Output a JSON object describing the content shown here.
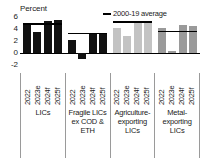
{
  "figure": {
    "axis_unit_label": "Percent",
    "legend": {
      "marker_name": "average-line-marker",
      "label": "2000-19 average"
    }
  },
  "chart_data": {
    "type": "bar",
    "title": "",
    "subtitle": "",
    "xlabel": "",
    "ylabel": "Percent",
    "ylim": [
      -2,
      6
    ],
    "yticks": [
      6,
      4,
      2,
      0,
      -2
    ],
    "ytick_labels": [
      "6",
      "4",
      "2",
      "0",
      "-2"
    ],
    "grid": false,
    "legend_position": "top-right",
    "legend_entries": [
      "2000-19 average"
    ],
    "categories": [
      "2022",
      "2023e",
      "2024f",
      "2025f"
    ],
    "groups": [
      {
        "name": "LICs",
        "color": "#111111",
        "values": [
          4.8,
          3.5,
          5.3,
          5.5
        ],
        "average_2000_19": 5.0
      },
      {
        "name": "Fragile LICs ex COD & ETH",
        "color": "#111111",
        "values": [
          2.2,
          -1.0,
          3.3,
          3.3
        ],
        "average_2000_19": 3.4
      },
      {
        "name": "Agriculture-exporting LICs",
        "color": "#c3c3c3",
        "values": [
          4.1,
          2.8,
          5.0,
          5.1
        ],
        "average_2000_19": 5.3
      },
      {
        "name": "Metal-exporting LICs",
        "color": "#9a9a9a",
        "values": [
          4.2,
          0.3,
          4.6,
          4.5
        ],
        "average_2000_19": 3.7
      }
    ]
  }
}
